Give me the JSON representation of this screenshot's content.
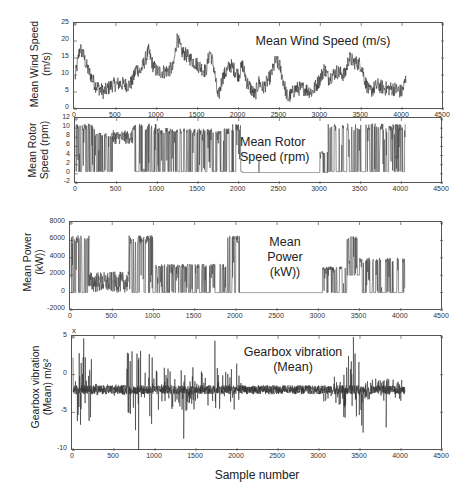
{
  "chart_data": [
    {
      "type": "line",
      "title": "Mean Wind Speed (m/s)",
      "ylabel": "Mean Wind Speed (m/s)",
      "ylabel_lines": [
        "Mean Wind Speed",
        "(m/s)"
      ],
      "title_lines": [
        "Mean Wind Speed (m/s)"
      ],
      "xlabel": "",
      "xlim": [
        0,
        4500
      ],
      "ylim": [
        0,
        25
      ],
      "xticks": [
        0,
        500,
        1000,
        1500,
        2000,
        2500,
        3000,
        3500,
        4000,
        4500
      ],
      "yticks": [
        0,
        5,
        10,
        15,
        20,
        25
      ],
      "grid": false,
      "series": [
        {
          "name": "Mean Wind Speed",
          "color": "#333333",
          "x": [
            0,
            60,
            100,
            150,
            250,
            350,
            450,
            550,
            650,
            700,
            750,
            800,
            900,
            950,
            1000,
            1100,
            1200,
            1250,
            1300,
            1400,
            1500,
            1600,
            1650,
            1700,
            1750,
            1800,
            1900,
            2000,
            2050,
            2100,
            2200,
            2250,
            2300,
            2400,
            2450,
            2500,
            2550,
            2600,
            2700,
            2800,
            2900,
            3000,
            3050,
            3100,
            3200,
            3300,
            3350,
            3400,
            3500,
            3550,
            3600,
            3700,
            3800,
            3900,
            4000,
            4050
          ],
          "values": [
            9,
            18,
            16,
            12,
            7,
            5,
            7,
            7.5,
            7,
            8,
            12,
            11,
            17,
            13,
            11,
            11,
            12,
            21,
            17,
            15,
            13,
            11,
            17,
            12,
            3,
            9,
            13,
            10,
            13,
            8,
            4,
            8,
            6,
            10,
            14,
            13,
            8,
            3,
            6,
            6,
            5,
            9,
            12,
            9,
            11,
            10,
            15,
            14,
            13,
            8,
            5,
            7,
            6,
            6,
            5,
            9
          ],
          "noise": 2.2
        }
      ]
    },
    {
      "type": "line",
      "title": "Mean Rotor Speed (rpm)",
      "ylabel": "Mean Rotor Speed (rpm)",
      "ylabel_lines": [
        "Mean Rotor",
        "Speed (rpm)"
      ],
      "title_lines": [
        "Mean Rotor",
        "Speed (rpm)"
      ],
      "xlabel": "",
      "xlim": [
        0,
        4500
      ],
      "ylim": [
        -2,
        12
      ],
      "xticks": [
        0,
        500,
        1000,
        1500,
        2000,
        2500,
        3000,
        3500,
        4000,
        4500
      ],
      "yticks": [
        -2,
        0,
        2,
        4,
        6,
        8,
        10,
        12
      ],
      "grid": false,
      "series": [
        {
          "name": "Mean Rotor Speed",
          "color": "#444444",
          "segments": [
            {
              "from": 0,
              "to": 230,
              "mode": "switch",
              "high": 11,
              "low": 0.5
            },
            {
              "from": 230,
              "to": 450,
              "mode": "switch",
              "high": 9,
              "low": 0.5
            },
            {
              "from": 450,
              "to": 700,
              "mode": "wander",
              "center": 8,
              "spread": 1.5
            },
            {
              "from": 700,
              "to": 1000,
              "mode": "switch",
              "high": 11,
              "low": 0.5
            },
            {
              "from": 1000,
              "to": 1900,
              "mode": "switch",
              "high": 10,
              "low": 0.5
            },
            {
              "from": 1900,
              "to": 2050,
              "mode": "switch",
              "high": 11,
              "low": 0.5
            },
            {
              "from": 2050,
              "to": 3000,
              "mode": "flat",
              "value": 0.3
            },
            {
              "from": 3000,
              "to": 3100,
              "mode": "switch",
              "high": 5,
              "low": 0.3
            },
            {
              "from": 3100,
              "to": 4050,
              "mode": "switch",
              "high": 11,
              "low": 0.5
            }
          ],
          "spikes": [
            {
              "x": 2250,
              "value": 3
            }
          ]
        }
      ]
    },
    {
      "type": "line",
      "title": "Mean Power (kW))",
      "ylabel": "Mean Power (kW))",
      "ylabel_lines": [
        "Mean Power",
        "(kW))"
      ],
      "title_lines": [
        "Mean",
        "Power",
        "(kW))"
      ],
      "xlabel": "",
      "xlim": [
        0,
        4500
      ],
      "ylim": [
        -2000,
        8000
      ],
      "xticks": [
        0,
        500,
        1000,
        1500,
        2000,
        2500,
        3000,
        3500,
        4000,
        4500
      ],
      "yticks": [
        -2000,
        0,
        2000,
        4000,
        6000,
        8000
      ],
      "grid": false,
      "series": [
        {
          "name": "Mean Power",
          "color": "#444444",
          "segments": [
            {
              "from": 0,
              "to": 220,
              "mode": "switch",
              "high": 6600,
              "low": 0
            },
            {
              "from": 220,
              "to": 700,
              "mode": "wander",
              "center": 1200,
              "spread": 1200
            },
            {
              "from": 700,
              "to": 1000,
              "mode": "switch",
              "high": 6600,
              "low": 0
            },
            {
              "from": 1000,
              "to": 1900,
              "mode": "switch",
              "high": 3300,
              "low": 0
            },
            {
              "from": 1900,
              "to": 2050,
              "mode": "switch",
              "high": 6600,
              "low": 0
            },
            {
              "from": 2050,
              "to": 3050,
              "mode": "flat",
              "value": 0
            },
            {
              "from": 3050,
              "to": 3350,
              "mode": "switch",
              "high": 3000,
              "low": 0
            },
            {
              "from": 3350,
              "to": 3500,
              "mode": "switch",
              "high": 6600,
              "low": 2000
            },
            {
              "from": 3500,
              "to": 4050,
              "mode": "switch",
              "high": 4000,
              "low": 0
            }
          ]
        }
      ]
    },
    {
      "type": "line",
      "title": "Gearbox vibration (Mean)",
      "ylabel": "Gearbox vibration (Mean) m/s²",
      "ylabel_lines": [
        "Gearbox vibration",
        "(Mean) m/s²"
      ],
      "title_lines": [
        "Gearbox vibration",
        "(Mean)"
      ],
      "xlabel": "Sample number",
      "xlim": [
        0,
        4500
      ],
      "ylim": [
        -10,
        5
      ],
      "y_multiplier": "x 10",
      "y_multiplier_exp": "-3",
      "xticks": [
        0,
        500,
        1000,
        1500,
        2000,
        2500,
        3000,
        3500,
        4000,
        4500
      ],
      "yticks": [
        -10,
        -5,
        0,
        5
      ],
      "grid": false,
      "series": [
        {
          "name": "Gearbox vibration",
          "color": "#333333",
          "baseline": -2,
          "segments": [
            {
              "from": 0,
              "to": 230,
              "amp": 5
            },
            {
              "from": 230,
              "to": 650,
              "amp": 0.8
            },
            {
              "from": 650,
              "to": 1000,
              "amp": 5.5
            },
            {
              "from": 1000,
              "to": 1950,
              "amp": 3
            },
            {
              "from": 1950,
              "to": 2050,
              "amp": 4
            },
            {
              "from": 2050,
              "to": 3050,
              "amp": 0.6
            },
            {
              "from": 3050,
              "to": 3300,
              "amp": 2
            },
            {
              "from": 3300,
              "to": 3550,
              "amp": 6
            },
            {
              "from": 3550,
              "to": 4050,
              "amp": 1.5
            }
          ],
          "spikes": [
            {
              "x": 130,
              "value": 4.8
            },
            {
              "x": 800,
              "value": -10
            },
            {
              "x": 1730,
              "value": 4.5
            },
            {
              "x": 1350,
              "value": -8.5
            },
            {
              "x": 3420,
              "value": 5
            },
            {
              "x": 3820,
              "value": -7
            }
          ]
        }
      ]
    }
  ],
  "figure": {
    "xlabel": "Sample number"
  }
}
